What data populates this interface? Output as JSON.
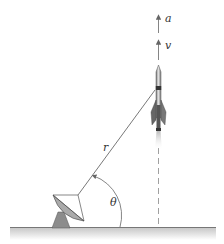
{
  "diagram": {
    "labels": {
      "acceleration": "a",
      "velocity": "v",
      "range": "r",
      "angle": "θ"
    },
    "colors": {
      "line": "#555555",
      "ground": "#888888",
      "rocket_body": "#9a9a9a",
      "rocket_dark": "#333333",
      "dish": "#8c8c8c",
      "background": "#ffffff"
    },
    "elements": [
      "radar-dish",
      "rocket",
      "range-line-r",
      "angle-arc-theta",
      "vertical-dashed-path",
      "acceleration-vector-a",
      "velocity-vector-v",
      "ground"
    ]
  }
}
